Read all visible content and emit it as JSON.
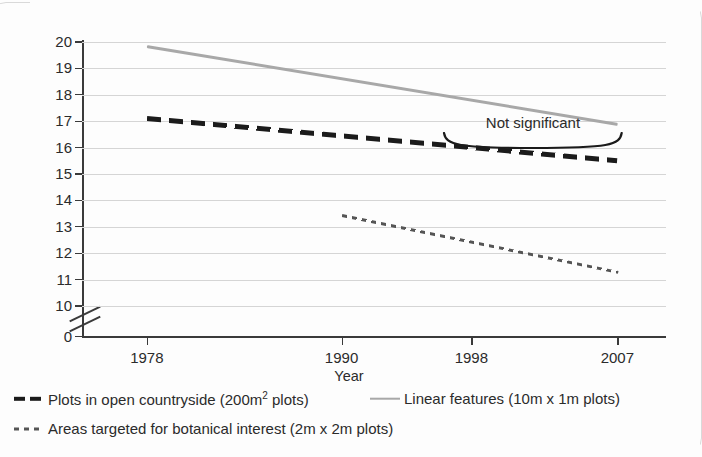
{
  "chart_data": {
    "type": "line",
    "title": "",
    "xlabel": "Year",
    "ylabel": "Species richness (No. of species per plot)",
    "xticks": [
      1978,
      1990,
      1998,
      2007
    ],
    "xtick_labels": [
      "1978",
      "1990",
      "1998",
      "2007"
    ],
    "xlim": [
      1974,
      2010
    ],
    "yticks": [
      10,
      11,
      12,
      13,
      14,
      15,
      16,
      17,
      18,
      19,
      20
    ],
    "ytick_labels": [
      "10",
      "11",
      "12",
      "13",
      "14",
      "15",
      "16",
      "17",
      "18",
      "19",
      "20"
    ],
    "y_broken_axis_base_label": "0",
    "ylim": [
      10,
      20
    ],
    "grid": "horizontal",
    "legend_position": "below",
    "series": [
      {
        "name": "Plots in open countryside (200m2 plots)",
        "style": "thick-dashed",
        "color": "#1b1b1b",
        "x": [
          1978,
          2007
        ],
        "y": [
          17.2,
          15.6
        ]
      },
      {
        "name": "Linear features (10m x 1m plots)",
        "style": "solid",
        "color": "#a8a8a8",
        "x": [
          1978,
          2007
        ],
        "y": [
          19.9,
          16.95
        ]
      },
      {
        "name": "Areas targeted for botanical interest (2m x 2m plots)",
        "style": "dotted",
        "color": "#555555",
        "x": [
          1990,
          2007
        ],
        "y": [
          13.5,
          11.35
        ]
      }
    ],
    "annotations": [
      {
        "text": "Not significant",
        "x_start": 1996.2,
        "x_end": 2007.4,
        "y": 16.45,
        "marker": "curved-brace-below"
      }
    ]
  },
  "legend": {
    "rows": [
      [
        {
          "swatch": "thick-dashed",
          "label_pre": "Plots in open countryside (200m",
          "label_sup": "2",
          "label_post": " plots)"
        },
        {
          "swatch": "solid",
          "label_pre": "Linear features (10m x 1m plots)",
          "label_sup": "",
          "label_post": ""
        }
      ],
      [
        {
          "swatch": "dotted",
          "label_pre": "Areas targeted for botanical interest (2m x 2m plots)",
          "label_sup": "",
          "label_post": ""
        }
      ]
    ]
  }
}
